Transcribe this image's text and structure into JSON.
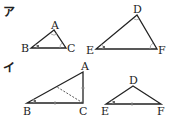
{
  "sections": [
    {
      "label": "ア",
      "triangles": [
        {
          "name": "ABC",
          "vertices": {
            "A": "A",
            "B": "B",
            "C": "C"
          }
        },
        {
          "name": "DEF",
          "vertices": {
            "D": "D",
            "E": "E",
            "F": "F"
          }
        }
      ]
    },
    {
      "label": "イ",
      "triangles": [
        {
          "name": "ABC",
          "vertices": {
            "A": "A",
            "B": "B",
            "C": "C"
          }
        },
        {
          "name": "DEF",
          "vertices": {
            "D": "D",
            "E": "E",
            "F": "F"
          }
        }
      ]
    }
  ]
}
